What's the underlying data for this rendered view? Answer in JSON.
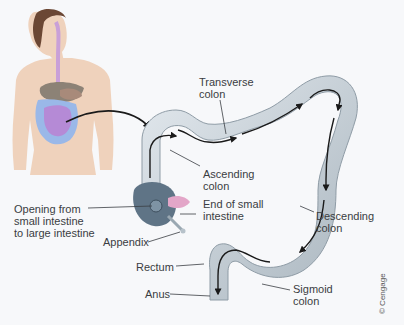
{
  "figure": {
    "inset": "female torso showing digestive tract",
    "colors": {
      "background": "#f7f8fa",
      "colon_fill": "#c9d3da",
      "colon_shadow": "#97a4ae",
      "cecum": "#5f7486",
      "small_intestine_end": "#e3a6c8",
      "skin": "#efd2bc",
      "hair": "#6b4734",
      "digestive_tract": "#c9a0d8",
      "small_intestine_inset": "#b58ad6",
      "large_intestine_inset": "#9ab8e8",
      "arrow": "#1a1a1a",
      "label_text": "#3a3d42"
    }
  },
  "labels": {
    "transverse_colon": [
      "Transverse",
      "colon"
    ],
    "ascending_colon": [
      "Ascending",
      "colon"
    ],
    "end_small_intestine": [
      "End of small",
      "intestine"
    ],
    "opening": [
      "Opening from",
      "small intestine",
      "to large intestine"
    ],
    "appendix": [
      "Appendix"
    ],
    "descending_colon": [
      "Descending",
      "colon"
    ],
    "rectum": [
      "Rectum"
    ],
    "anus": [
      "Anus"
    ],
    "sigmoid_colon": [
      "Sigmoid",
      "colon"
    ]
  },
  "credit": "© Cengage"
}
